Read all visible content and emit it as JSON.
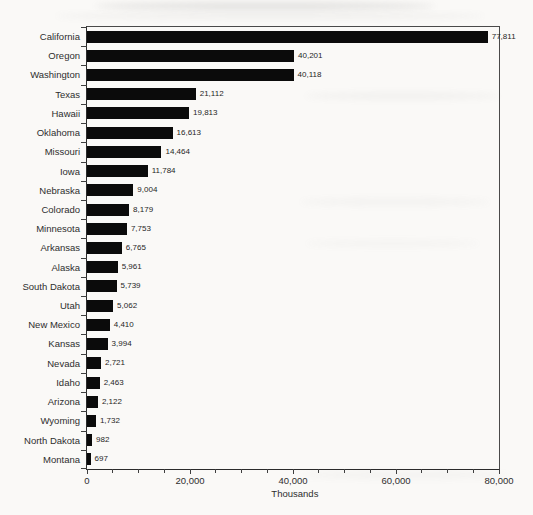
{
  "chart_data": {
    "type": "bar",
    "orientation": "horizontal",
    "title": "",
    "xlabel": "Thousands",
    "ylabel": "",
    "xlim": [
      0,
      80000
    ],
    "minor_tick_interval": 5000,
    "major_tick_interval": 20000,
    "grid": false,
    "legend": false,
    "bar_color": "#0b0b0b",
    "axis_color": "#3f3f3f",
    "text_color": "#2e2e2e",
    "categories": [
      "California",
      "Oregon",
      "Washington",
      "Texas",
      "Hawaii",
      "Oklahoma",
      "Missouri",
      "Iowa",
      "Nebraska",
      "Colorado",
      "Minnesota",
      "Arkansas",
      "Alaska",
      "South Dakota",
      "Utah",
      "New Mexico",
      "Kansas",
      "Nevada",
      "Idaho",
      "Arizona",
      "Wyoming",
      "North Dakota",
      "Montana"
    ],
    "values": [
      77811,
      40201,
      40118,
      21112,
      19813,
      16613,
      14464,
      11784,
      9004,
      8179,
      7753,
      6765,
      5961,
      5739,
      5062,
      4410,
      3994,
      2721,
      2463,
      2122,
      1732,
      982,
      697
    ],
    "value_labels": [
      "77,811",
      "40,201",
      "40,118",
      "21,112",
      "19,813",
      "16,613",
      "14,464",
      "11,784",
      "9,004",
      "8,179",
      "7,753",
      "6,765",
      "5,961",
      "5,739",
      "5,062",
      "4,410",
      "3,994",
      "2,721",
      "2,463",
      "2,122",
      "1,732",
      "982",
      "697"
    ],
    "x_ticks": [
      {
        "value": 0,
        "label": "0"
      },
      {
        "value": 20000,
        "label": "20,000"
      },
      {
        "value": 40000,
        "label": "40,000"
      },
      {
        "value": 60000,
        "label": "60,000"
      },
      {
        "value": 80000,
        "label": "80,000"
      }
    ]
  }
}
